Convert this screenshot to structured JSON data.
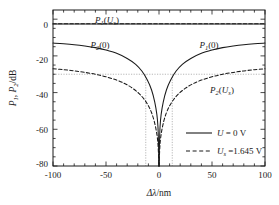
{
  "chart_data": {
    "type": "line",
    "title": "",
    "xlabel": "Δλ /nm",
    "ylabel": "P₁, P₂ /dB",
    "xlim": [
      -100,
      100
    ],
    "ylim": [
      -80,
      5
    ],
    "xticks": [
      -100,
      -50,
      0,
      50,
      100
    ],
    "yticks": [
      0,
      -20,
      -40,
      -60,
      -80
    ],
    "xtick_labels": [
      "-100",
      "-50",
      "0",
      "50",
      "100"
    ],
    "ytick_labels": [
      "0",
      "-20",
      "-40",
      "-60",
      "-80"
    ],
    "grid": false,
    "legend_position": "lower-right",
    "annotations": [
      {
        "text": "P1(Us)",
        "x": -38,
        "y": 2,
        "label_main": "P",
        "label_sub": "1",
        "arg_main": "U",
        "arg_sub": "s"
      },
      {
        "text": "P2(0)",
        "x": -50,
        "y": -13,
        "label_main": "P",
        "label_sub": "2",
        "arg_main": "0",
        "arg_sub": ""
      },
      {
        "text": "P1(0)",
        "x": 40,
        "y": -13,
        "label_main": "P",
        "label_sub": "1",
        "arg_main": "0",
        "arg_sub": ""
      },
      {
        "text": "P2(Us)",
        "x": 58,
        "y": -36,
        "label_main": "P",
        "label_sub": "2",
        "arg_main": "U",
        "arg_sub": "s"
      }
    ],
    "guide_lines": {
      "horizontal_db": -30,
      "vertical_nm": [
        -12.5,
        12.5
      ],
      "style": "dotted"
    },
    "series": [
      {
        "name": "P1(Us)",
        "style": "dashed",
        "color": "#1a1a1a",
        "description": "flat near -2.5 dB across full range",
        "x": [
          -100,
          -80,
          -60,
          -40,
          -20,
          -10,
          0,
          10,
          20,
          40,
          60,
          80,
          100
        ],
        "values": [
          -2.5,
          -2.5,
          -2.5,
          -2.5,
          -2.5,
          -2.5,
          -2.5,
          -2.5,
          -2.5,
          -2.5,
          -2.5,
          -2.5,
          -2.5
        ]
      },
      {
        "name": "P1(Us)-overlay",
        "style": "solid",
        "color": "#1a1a1a",
        "description": "solid line overlapping the flat top trace",
        "x": [
          -100,
          0,
          100
        ],
        "values": [
          -2.6,
          -2.6,
          -2.6
        ]
      },
      {
        "name": "P2(0)",
        "style": "solid",
        "color": "#1a1a1a",
        "description": "left branch of solid notch, from -13 dB at -100 nm down to below -80 dB at 0",
        "x": [
          -100,
          -90,
          -80,
          -70,
          -60,
          -50,
          -40,
          -30,
          -22,
          -16,
          -11,
          -7,
          -4,
          -2,
          -1,
          -0.4,
          0
        ],
        "values": [
          -13,
          -13.4,
          -13.9,
          -14.6,
          -15.5,
          -16.8,
          -18.6,
          -21.4,
          -24.6,
          -28.4,
          -33.2,
          -38.6,
          -45.2,
          -52.0,
          -58.5,
          -69,
          -80
        ]
      },
      {
        "name": "P1(0)",
        "style": "solid",
        "color": "#1a1a1a",
        "description": "right branch of solid notch, mirror of P2(0)",
        "x": [
          0,
          0.4,
          1,
          2,
          4,
          7,
          11,
          16,
          22,
          30,
          40,
          50,
          60,
          70,
          80,
          90,
          100
        ],
        "values": [
          -80,
          -69,
          -58.5,
          -52.0,
          -45.2,
          -38.6,
          -33.2,
          -28.4,
          -24.6,
          -21.4,
          -18.6,
          -16.8,
          -15.5,
          -14.6,
          -13.9,
          -13.4,
          -13
        ]
      },
      {
        "name": "P2(Us)-left",
        "style": "dashed",
        "color": "#1a1a1a",
        "description": "left branch of dashed notch, from -27 dB at -100 nm down past -60 dB near 0",
        "x": [
          -100,
          -90,
          -80,
          -70,
          -60,
          -50,
          -40,
          -32,
          -25,
          -19,
          -14,
          -10,
          -7,
          -4.5,
          -2.5,
          -1.2,
          -0.5,
          0
        ],
        "values": [
          -27,
          -27.5,
          -28.2,
          -29.0,
          -30.0,
          -31.4,
          -33.2,
          -35.2,
          -37.6,
          -40.4,
          -43.6,
          -47.2,
          -51.0,
          -55.6,
          -61.0,
          -66.5,
          -73,
          -80
        ]
      },
      {
        "name": "P2(Us)-right",
        "style": "dashed",
        "color": "#1a1a1a",
        "description": "right branch of dashed notch, mirror image",
        "x": [
          0,
          0.5,
          1.2,
          2.5,
          4.5,
          7,
          10,
          14,
          19,
          25,
          32,
          40,
          50,
          60,
          70,
          80,
          90,
          100
        ],
        "values": [
          -80,
          -73,
          -66.5,
          -61.0,
          -55.6,
          -51.0,
          -47.2,
          -43.6,
          -40.4,
          -37.6,
          -35.2,
          -33.2,
          -31.4,
          -30.0,
          -29.0,
          -28.2,
          -27.5,
          -27
        ]
      }
    ],
    "legend": [
      {
        "label": "U = 0 V",
        "style": "solid",
        "sym": "U",
        "sub": "",
        "value": "0 V"
      },
      {
        "label": "Us = 1.645 V",
        "style": "dashed",
        "sym": "U",
        "sub": "s",
        "value": "1.645 V"
      }
    ]
  },
  "axis": {
    "x_symbol": "Δλ",
    "x_unit": "/nm",
    "y_symbol_1": "P",
    "y_sub_1": "1",
    "y_symbol_2": "P",
    "y_sub_2": "2",
    "y_unit": "/dB",
    "y_comma": ", "
  },
  "labels": {
    "p1_us_main": "P",
    "p1_us_sub": "1",
    "p1_us_arg_open": "(",
    "p1_us_arg": "U",
    "p1_us_arg_sub": "s",
    "p1_us_arg_close": ")",
    "p2_zero_main": "P",
    "p2_zero_sub": "2",
    "p2_zero_arg": "(0)",
    "p1_zero_main": "P",
    "p1_zero_sub": "1",
    "p1_zero_arg": "(0)",
    "p2_us_main": "P",
    "p2_us_sub": "2",
    "p2_us_arg_open": "(",
    "p2_us_arg": "U",
    "p2_us_arg_sub": "s",
    "p2_us_arg_close": ")"
  },
  "legend_text": {
    "row1_sym": "U",
    "row1_eq": " = 0 V",
    "row2_sym": "U",
    "row2_sub": "s",
    "row2_eq": " =1.645 V"
  },
  "ticks": {
    "x": [
      "-100",
      "-50",
      "0",
      "50",
      "100"
    ],
    "y": [
      "0",
      "-20",
      "-40",
      "-60",
      "-80"
    ]
  },
  "colors": {
    "axis": "#1a1a1a",
    "curve": "#1a1a1a",
    "guide": "#999999",
    "background": "#ffffff"
  }
}
